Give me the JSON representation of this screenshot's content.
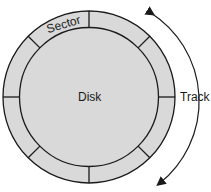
{
  "diagram": {
    "labels": {
      "sector": "Sector",
      "disk": "Disk",
      "track": "Track"
    },
    "colors": {
      "fill": "#d9d9d9",
      "stroke": "#1a1a1a",
      "background": "#ffffff"
    },
    "sector_count": 8
  }
}
